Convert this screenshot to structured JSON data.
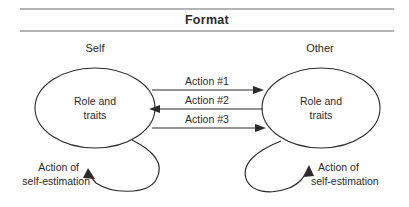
{
  "figure": {
    "title": "Format",
    "width": 409,
    "height": 207,
    "background_color": "#ffffff",
    "line_color": "#2b2b2b",
    "rule_color": "#9b9b9b"
  },
  "columns": {
    "left_heading": "Self",
    "right_heading": "Other"
  },
  "nodes": {
    "left": {
      "line1": "Role and",
      "line2": "traits"
    },
    "right": {
      "line1": "Role and",
      "line2": "traits"
    }
  },
  "flows": [
    {
      "label": "Action #1",
      "direction": "right"
    },
    {
      "label": "Action #2",
      "direction": "left"
    },
    {
      "label": "Action #3",
      "direction": "right"
    }
  ],
  "self_loops": {
    "left": {
      "line1": "Action of",
      "line2": "self-estimation"
    },
    "right": {
      "line1": "Action of",
      "line2": "self-estimation"
    }
  }
}
